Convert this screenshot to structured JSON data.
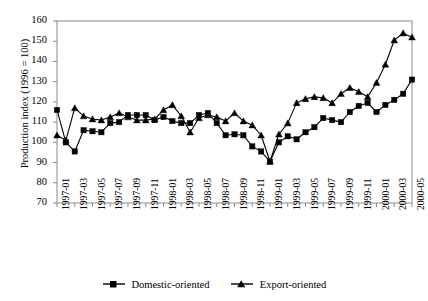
{
  "chart_data": {
    "type": "line",
    "title": "",
    "xlabel": "",
    "ylabel": "Production index (1996 = 100)",
    "ylim": [
      70,
      160
    ],
    "yticks": [
      70,
      80,
      90,
      100,
      110,
      120,
      130,
      140,
      150,
      160
    ],
    "grid": false,
    "legend_position": "bottom",
    "x": [
      "1997-01",
      "1997-02",
      "1997-03",
      "1997-04",
      "1997-05",
      "1997-06",
      "1997-07",
      "1997-08",
      "1997-09",
      "1997-10",
      "1997-11",
      "1997-12",
      "1998-01",
      "1998-02",
      "1998-03",
      "1998-04",
      "1998-05",
      "1998-06",
      "1998-07",
      "1998-08",
      "1998-09",
      "1998-10",
      "1998-11",
      "1998-12",
      "1999-01",
      "1999-02",
      "1999-03",
      "1999-04",
      "1999-05",
      "1999-06",
      "1999-07",
      "1999-08",
      "1999-09",
      "1999-10",
      "1999-11",
      "1999-12",
      "2000-01",
      "2000-02",
      "2000-03",
      "2000-04",
      "2000-05"
    ],
    "xticklabels": [
      "1997-01",
      "1997-03",
      "1997-05",
      "1997-07",
      "1997-09",
      "1997-11",
      "1998-01",
      "1998-03",
      "1998-05",
      "1998-07",
      "1998-09",
      "1998-11",
      "1999-01",
      "1999-03",
      "1999-05",
      "1999-07",
      "1999-09",
      "1999-11",
      "2000-01",
      "2000-03",
      "2000-05"
    ],
    "series": [
      {
        "name": "Domestic-oriented",
        "marker": "square",
        "color": "#000000",
        "values": [
          116,
          100,
          95.5,
          106,
          105.5,
          105,
          109.5,
          110,
          113.5,
          113.5,
          113.5,
          111,
          112.5,
          110.5,
          109.5,
          109.5,
          113.5,
          114.5,
          109.5,
          103.5,
          104,
          103.5,
          98,
          95.5,
          90.5,
          100,
          103,
          101.5,
          105,
          107.5,
          112,
          111,
          110,
          115,
          118,
          119.5,
          115,
          118.5,
          121,
          124,
          131
        ]
      },
      {
        "name": "Export-oriented",
        "marker": "triangle",
        "color": "#000000",
        "values": [
          103.5,
          101,
          117,
          113,
          111.5,
          111,
          112.5,
          114.5,
          112.5,
          111,
          111,
          111.5,
          116,
          118.5,
          113,
          105,
          112,
          113.5,
          112.5,
          110.5,
          114.5,
          110.5,
          108.5,
          103.5,
          90.5,
          104,
          109.5,
          119.5,
          121.5,
          122.5,
          122,
          119.5,
          124,
          127,
          125,
          122.5,
          129.5,
          138.5,
          150.5,
          154,
          152
        ]
      }
    ]
  }
}
